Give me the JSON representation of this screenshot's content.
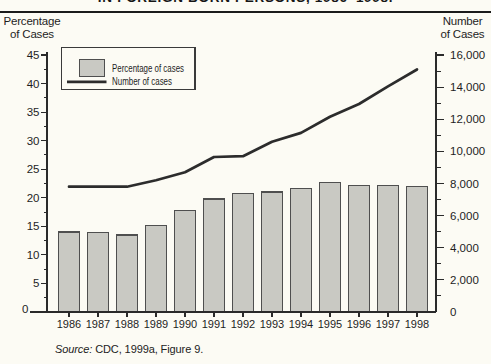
{
  "title_fragment": "IN FOREIGN BORN PERSONS, 1986–1998.",
  "left_axis_title": {
    "line1": "Percentage",
    "line2": "of Cases"
  },
  "right_axis_title": {
    "line1": "Number",
    "line2": "of Cases"
  },
  "legend": {
    "bar_label": "Percentage of cases",
    "line_label": "Number of cases"
  },
  "source": {
    "prefix": "Source:",
    "citation": " CDC, 1999a, Figure 9."
  },
  "colors": {
    "paper": "#fcfbf4",
    "ink": "#1e1e1e",
    "axis": "#2a2a2a",
    "bar_fill": "#c9c9c3",
    "bar_stroke": "#4f4f4f",
    "line": "#2c2c2c",
    "legend_border": "#3a3a3a"
  },
  "chart_data": {
    "type": "bar",
    "subtype": "bar+line combo, dual axis",
    "categories": [
      1986,
      1987,
      1988,
      1989,
      1990,
      1991,
      1992,
      1993,
      1994,
      1995,
      1996,
      1997,
      1998
    ],
    "series": [
      {
        "name": "Percentage of cases",
        "type": "bar",
        "axis": "left",
        "values": [
          14.0,
          13.9,
          13.5,
          15.2,
          17.8,
          19.8,
          20.7,
          21.0,
          21.6,
          22.7,
          22.1,
          22.1,
          22.0
        ]
      },
      {
        "name": "Number of cases",
        "type": "line",
        "axis": "right",
        "values": [
          7800,
          7800,
          7800,
          8200,
          8700,
          9650,
          9700,
          10600,
          11150,
          12150,
          12950,
          14050,
          15100
        ]
      }
    ],
    "left_axis": {
      "label": "Percentage of Cases",
      "min": 0,
      "max": 45,
      "major_step": 5,
      "minor_step": 2.5
    },
    "right_axis": {
      "label": "Number of Cases",
      "min": 0,
      "max": 16000,
      "major_step": 2000,
      "minor_step": 1000
    },
    "grid": false,
    "legend_position": "top-left inside plot",
    "title_fragment": "IN FOREIGN BORN PERSONS, 1986–1998.",
    "source": "Source: CDC, 1999a, Figure 9."
  }
}
